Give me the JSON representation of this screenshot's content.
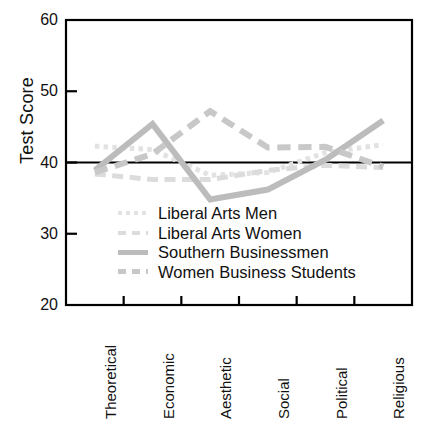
{
  "chart_data": {
    "type": "line",
    "title": "",
    "xlabel": "",
    "ylabel": "Test Score",
    "categories": [
      "Theoretical",
      "Economic",
      "Aesthetic",
      "Social",
      "Political",
      "Religious"
    ],
    "ylim": [
      20,
      60
    ],
    "yticks": [
      20,
      30,
      40,
      50,
      60
    ],
    "ytick_labels": [
      "20",
      "30",
      "40",
      "50",
      "60"
    ],
    "grid": false,
    "legend_position": "inside-lower-center",
    "reference_line": {
      "value": 40,
      "color": "#000000",
      "style": "solid"
    },
    "series": [
      {
        "name": "Liberal Arts Men",
        "values": [
          42.3,
          41.8,
          38.2,
          38.6,
          41.4,
          42.5
        ],
        "color": "#e2e2e2",
        "style": "dotted",
        "width": 5
      },
      {
        "name": "Liberal Arts Women",
        "values": [
          38.4,
          37.6,
          37.6,
          38.9,
          39.6,
          39.3
        ],
        "color": "#dcdcdc",
        "style": "dashed",
        "width": 5
      },
      {
        "name": "Southern Businessmen",
        "values": [
          38.9,
          45.4,
          34.8,
          36.2,
          40.4,
          45.9
        ],
        "color": "#bcbcbc",
        "style": "solid",
        "width": 6
      },
      {
        "name": "Women Business Students",
        "values": [
          38.6,
          41.2,
          47.2,
          42.1,
          42.2,
          39.4
        ],
        "color": "#c8c8c8",
        "style": "dashed",
        "width": 6
      }
    ]
  },
  "axis": {
    "y_title": "Test Score",
    "y_tick_0": "20",
    "y_tick_1": "30",
    "y_tick_2": "40",
    "y_tick_3": "50",
    "y_tick_4": "60",
    "x_label_0": "Theoretical",
    "x_label_1": "Economic",
    "x_label_2": "Aesthetic",
    "x_label_3": "Social",
    "x_label_4": "Political",
    "x_label_5": "Religious"
  },
  "legend": {
    "items": [
      {
        "label": "Liberal Arts Men"
      },
      {
        "label": "Liberal Arts Women"
      },
      {
        "label": "Southern Businessmen"
      },
      {
        "label": "Women Business Students"
      }
    ]
  }
}
